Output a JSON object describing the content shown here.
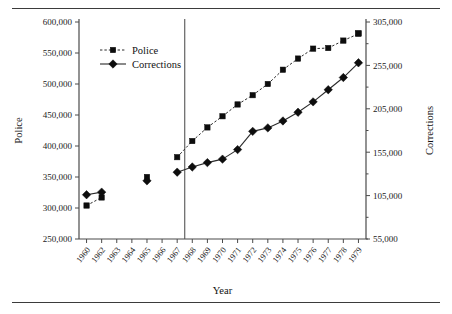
{
  "figure": {
    "x_axis_title": "Year",
    "left_axis_title": "Police",
    "right_axis_title": "Corrections"
  },
  "legend": {
    "items": [
      {
        "label": "Police",
        "marker": "square-marker",
        "line": "dashed"
      },
      {
        "label": "Corrections",
        "marker": "diamond-marker",
        "line": "solid"
      }
    ]
  },
  "chart_data": {
    "type": "line",
    "title": "",
    "xlabel": "Year",
    "ylabel": "Police",
    "y2label": "Corrections",
    "grid": false,
    "legend_position": "upper-left-inside",
    "categories": [
      "1960",
      "1962",
      "1963",
      "1964",
      "1965",
      "1966",
      "1967",
      "1968",
      "1969",
      "1970",
      "1971",
      "1972",
      "1973",
      "1974",
      "1975",
      "1976",
      "1977",
      "1978",
      "1979"
    ],
    "ylim": [
      250000,
      600000
    ],
    "yticks": [
      "250,000",
      "300,000",
      "350,000",
      "400,000",
      "450,000",
      "500,000",
      "550,000",
      "600,000"
    ],
    "ytick_values": [
      250000,
      300000,
      350000,
      400000,
      450000,
      500000,
      550000,
      600000
    ],
    "y2lim": [
      55000,
      305000
    ],
    "y2ticks": [
      "55,000",
      "105,000",
      "155,000",
      "205,000",
      "255,000",
      "305,000"
    ],
    "y2tick_values": [
      55000,
      105000,
      155000,
      205000,
      255000,
      305000
    ],
    "annotations": [
      {
        "type": "vertical-reference-line",
        "between": [
          "1967",
          "1968"
        ]
      }
    ],
    "series": [
      {
        "name": "Police",
        "axis": "left",
        "marker": "square",
        "linestyle": "dashed",
        "color": "#0d0d0d",
        "points": [
          {
            "x": "1960",
            "y": 304000
          },
          {
            "x": "1962",
            "y": 317000
          },
          {
            "x": "1965",
            "y": 350000
          },
          {
            "x": "1967",
            "y": 382000
          },
          {
            "x": "1968",
            "y": 408000
          },
          {
            "x": "1969",
            "y": 430000
          },
          {
            "x": "1970",
            "y": 448000
          },
          {
            "x": "1971",
            "y": 467000
          },
          {
            "x": "1972",
            "y": 482000
          },
          {
            "x": "1973",
            "y": 500000
          },
          {
            "x": "1974",
            "y": 523000
          },
          {
            "x": "1975",
            "y": 541000
          },
          {
            "x": "1976",
            "y": 557000
          },
          {
            "x": "1977",
            "y": 558000
          },
          {
            "x": "1978",
            "y": 570000
          },
          {
            "x": "1979",
            "y": 581000
          },
          {
            "x": "1979",
            "y": 582000
          }
        ]
      },
      {
        "name": "Corrections",
        "axis": "right",
        "marker": "diamond",
        "linestyle": "solid",
        "color": "#0d0d0d",
        "points": [
          {
            "x": "1960",
            "y": 106000
          },
          {
            "x": "1962",
            "y": 109000
          },
          {
            "x": "1965",
            "y": 122000
          },
          {
            "x": "1967",
            "y": 132000
          },
          {
            "x": "1968",
            "y": 138000
          },
          {
            "x": "1969",
            "y": 143000
          },
          {
            "x": "1970",
            "y": 147000
          },
          {
            "x": "1971",
            "y": 158000
          },
          {
            "x": "1972",
            "y": 179000
          },
          {
            "x": "1973",
            "y": 183000
          },
          {
            "x": "1974",
            "y": 191000
          },
          {
            "x": "1975",
            "y": 201000
          },
          {
            "x": "1976",
            "y": 213000
          },
          {
            "x": "1977",
            "y": 227000
          },
          {
            "x": "1978",
            "y": 241000
          },
          {
            "x": "1979",
            "y": 258000
          }
        ]
      }
    ]
  }
}
